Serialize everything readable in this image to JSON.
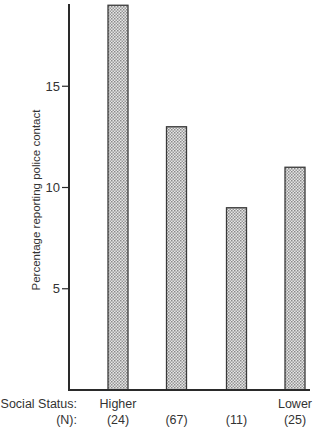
{
  "chart_data": {
    "type": "bar",
    "title": "",
    "xlabel": "Social Status",
    "ylabel": "Percentage reporting police contact",
    "categories": [
      "Higher",
      "",
      "",
      "Lower"
    ],
    "n_values": [
      "(24)",
      "(67)",
      "(11)",
      "(25)"
    ],
    "values": [
      19,
      13,
      9,
      11
    ],
    "ylim": [
      0,
      19
    ],
    "yticks": [
      5,
      10,
      15
    ],
    "grid": false,
    "legend": null,
    "row_labels": {
      "social_status": "Social Status:",
      "n": "(N):"
    },
    "style": {
      "bar_fill": "#cfcfcf",
      "bar_stroke": "#3a3a3a",
      "axis_color": "#2a2a2a"
    }
  }
}
